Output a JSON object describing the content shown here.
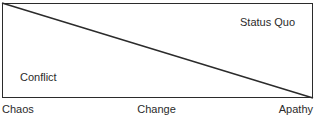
{
  "diagram": {
    "type": "quadrant-triangle-split",
    "background_color": "#ffffff",
    "stroke_color": "#2b2b2b",
    "text_color": "#2b2b2b",
    "regions": [
      {
        "key": "status_quo",
        "label": "Status Quo"
      },
      {
        "key": "conflict",
        "label": "Conflict"
      }
    ],
    "axis_labels": {
      "start": "Chaos",
      "middle": "Change",
      "end": "Apathy"
    }
  }
}
